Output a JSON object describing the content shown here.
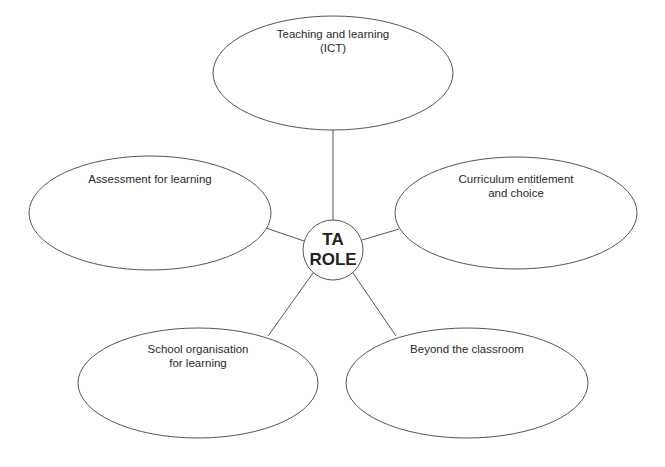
{
  "diagram": {
    "type": "spider-diagram",
    "center": {
      "label": "TA\nROLE",
      "cx": 333,
      "cy": 250,
      "r": 30
    },
    "nodes": [
      {
        "id": "top",
        "label": "Teaching and learning\n(ICT)",
        "cx": 333,
        "cy": 73,
        "rx": 120,
        "ry": 57,
        "label_y": 27,
        "edge": [
          333,
          130,
          333,
          220
        ]
      },
      {
        "id": "left",
        "label": "Assessment for learning",
        "cx": 150,
        "cy": 213,
        "rx": 121,
        "ry": 57,
        "label_y": 172,
        "edge": [
          266,
          228,
          304,
          241
        ]
      },
      {
        "id": "right",
        "label": "Curriculum entitlement\nand choice",
        "cx": 516,
        "cy": 213,
        "rx": 121,
        "ry": 56,
        "label_y": 172,
        "edge": [
          399,
          229,
          362,
          240
        ]
      },
      {
        "id": "bottom-left",
        "label": "School organisation\nfor learning",
        "cx": 198,
        "cy": 383,
        "rx": 120,
        "ry": 55,
        "label_y": 342,
        "edge": [
          268,
          336,
          313,
          273
        ]
      },
      {
        "id": "bottom-right",
        "label": "Beyond the classroom",
        "cx": 467,
        "cy": 383,
        "rx": 121,
        "ry": 55,
        "label_y": 342,
        "edge": [
          396,
          336,
          353,
          273
        ]
      }
    ],
    "colors": {
      "stroke": "#555555",
      "text": "#2b2b2b",
      "background": "#ffffff"
    }
  }
}
